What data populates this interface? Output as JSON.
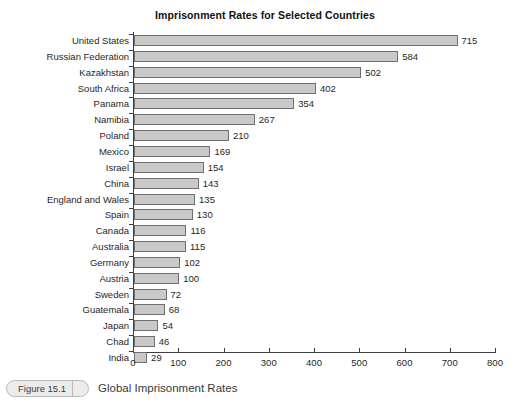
{
  "chart_data": {
    "type": "bar",
    "orientation": "horizontal",
    "title": "Imprisonment Rates for Selected Countries",
    "xlabel": "",
    "ylabel": "",
    "xlim": [
      0,
      800
    ],
    "x_ticks": [
      0,
      100,
      200,
      300,
      400,
      500,
      600,
      700,
      800
    ],
    "grid": false,
    "legend": null,
    "categories": [
      "United States",
      "Russian Federation",
      "Kazakhstan",
      "South Africa",
      "Panama",
      "Namibia",
      "Poland",
      "Mexico",
      "Israel",
      "China",
      "England and Wales",
      "Spain",
      "Canada",
      "Australia",
      "Germany",
      "Austria",
      "Sweden",
      "Guatemala",
      "Japan",
      "Chad",
      "India"
    ],
    "values": [
      715,
      584,
      502,
      402,
      354,
      267,
      210,
      169,
      154,
      143,
      135,
      130,
      116,
      115,
      102,
      100,
      72,
      68,
      54,
      46,
      29
    ],
    "bar_fill_color": "#c9c9c9",
    "bar_border_color": "#6f6f6f",
    "axis_color": "#3d3d3d"
  },
  "caption": {
    "figure_number": "Figure 15.1",
    "text": "Global Imprisonment Rates"
  }
}
